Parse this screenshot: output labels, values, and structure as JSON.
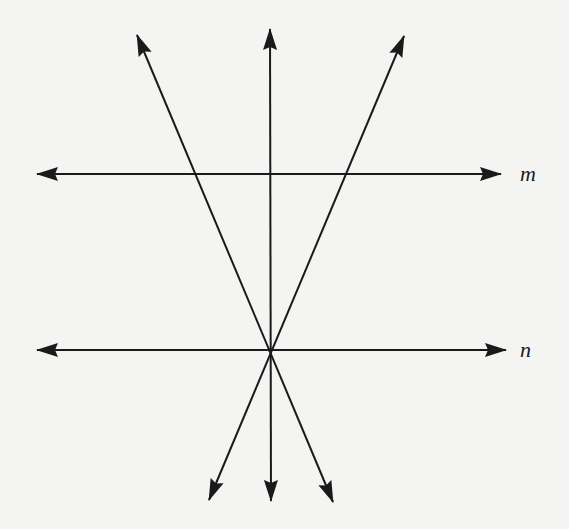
{
  "diagram": {
    "type": "geometry-lines",
    "colors": {
      "background": "#f4f4f2",
      "stroke": "#1a1a1a"
    },
    "labels": {
      "m": "m",
      "n": "n"
    },
    "lines": [
      {
        "id": "m",
        "label": "m",
        "from": [
          37,
          174
        ],
        "to": [
          501,
          174
        ],
        "arrows": "both"
      },
      {
        "id": "n",
        "label": "n",
        "from": [
          37,
          350
        ],
        "to": [
          506,
          350
        ],
        "arrows": "both"
      },
      {
        "id": "diag-left",
        "from": [
          137,
          35
        ],
        "to": [
          333,
          502
        ],
        "arrows": "both"
      },
      {
        "id": "vertical",
        "from": [
          270,
          29
        ],
        "to": [
          271,
          501
        ],
        "arrows": "both"
      },
      {
        "id": "diag-right",
        "from": [
          404,
          36
        ],
        "to": [
          209,
          500
        ],
        "arrows": "both"
      }
    ],
    "intersection_point": [
      270,
      350
    ]
  }
}
